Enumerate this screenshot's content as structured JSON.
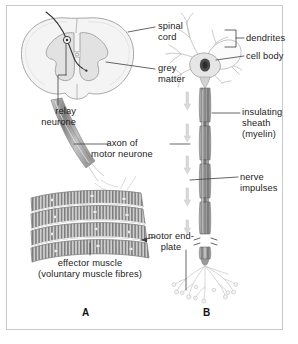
{
  "figure": {
    "background_color": "#ffffff",
    "frame_border_color": "#c9c9c9",
    "ink_color": "#1b1b1b"
  },
  "panels": [
    {
      "id": "A",
      "letter": "A",
      "subject": "spinal cord, relay neurone and effector muscle"
    },
    {
      "id": "B",
      "letter": "B",
      "subject": "motor neurone structure"
    }
  ],
  "labels": {
    "spinal_cord": {
      "text": "spinal\ncord",
      "line1": "spinal",
      "line2": "cord"
    },
    "grey_matter": {
      "text": "grey\nmatter",
      "line1": "grey",
      "line2": "matter"
    },
    "relay_neurone": {
      "line1": "relay",
      "line2": "neurone"
    },
    "axon_of_motor_neurone": {
      "line1": "axon of",
      "line2": "motor neurone"
    },
    "effector_muscle": {
      "line1": "effector muscle",
      "line2": "(voluntary muscle fibres)"
    },
    "dendrites": {
      "text": "dendrites"
    },
    "cell_body": {
      "text": "cell body"
    },
    "insulating_sheath": {
      "line1": "insulating",
      "line2": "sheath",
      "line3": "(myelin)"
    },
    "nerve_impulses": {
      "line1": "nerve",
      "line2": "impulses"
    },
    "motor_end_plate": {
      "line1": "motor end-",
      "line2": "plate"
    }
  },
  "colors": {
    "outline": "#8d8d8d",
    "grey_matter_fill": "#e4e4e4",
    "white_matter_fill": "#f2f2f2",
    "axon_dark": "#7a7a7a",
    "axon_darker": "#5e5e5e",
    "muscle_band": "#8a8a8a",
    "muscle_light": "#d6d6d6",
    "arrow_grey": "#d2d2d2",
    "leader_line": "#4a4a4a"
  }
}
